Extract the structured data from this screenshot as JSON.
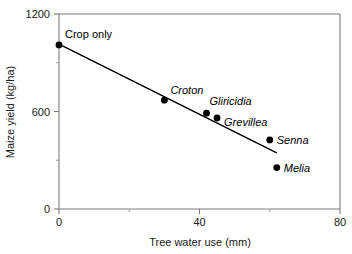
{
  "chart_data": {
    "type": "scatter",
    "title": "",
    "xlabel": "Tree water use (mm)",
    "ylabel": "Maize yield (kg/ha)",
    "xlim": [
      0,
      80
    ],
    "ylim": [
      0,
      1200
    ],
    "x_major_ticks": [
      0,
      40,
      80
    ],
    "x_major_tick_labels": [
      "0",
      "40",
      "80"
    ],
    "x_minor_ticks": [
      20,
      60
    ],
    "y_major_ticks": [
      0,
      600,
      1200
    ],
    "y_major_tick_labels": [
      "0",
      "600",
      "1200"
    ],
    "y_minor_ticks": [
      300,
      900
    ],
    "grid": false,
    "legend": "none",
    "points": [
      {
        "label": "Crop only",
        "x": 0,
        "y": 1010,
        "italic": false,
        "label_dx": 6,
        "label_dy": -7
      },
      {
        "label": "Croton",
        "x": 30,
        "y": 670,
        "italic": true,
        "label_dx": 6,
        "label_dy": -6
      },
      {
        "label": "Gliricidia",
        "x": 42,
        "y": 590,
        "italic": true,
        "label_dx": 3,
        "label_dy": -8
      },
      {
        "label": "Grevillea",
        "x": 45,
        "y": 560,
        "italic": true,
        "label_dx": 7,
        "label_dy": 8
      },
      {
        "label": "Senna",
        "x": 60,
        "y": 425,
        "italic": true,
        "label_dx": 7,
        "label_dy": 4
      },
      {
        "label": "Melia",
        "x": 62,
        "y": 255,
        "italic": true,
        "label_dx": 7,
        "label_dy": 4
      }
    ],
    "trendline": {
      "name": "regression-line",
      "x_start": 0,
      "y_start": 1015,
      "x_end": 62,
      "y_end": 345
    }
  }
}
